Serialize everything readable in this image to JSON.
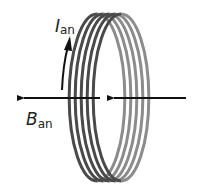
{
  "diagram": {
    "labels": {
      "current": {
        "symbol": "I",
        "subscript": "an"
      },
      "field": {
        "symbol": "B",
        "subscript": "an"
      }
    },
    "coil": {
      "loops": 5,
      "front_color": "#4a4a4a",
      "back_color": "#8c8c8c"
    },
    "arrows": {
      "external_field_direction": "left",
      "induced_field_direction": "left",
      "current_direction": "up",
      "color": "#111111"
    }
  }
}
